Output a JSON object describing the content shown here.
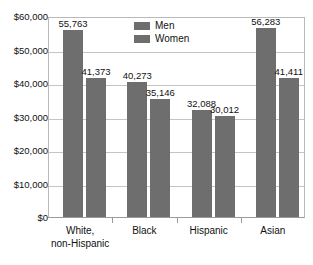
{
  "chart_data": {
    "type": "bar",
    "title": "",
    "xlabel": "",
    "ylabel": "",
    "categories": [
      "White, non-Hispanic",
      "Black",
      "Hispanic",
      "Asian"
    ],
    "category_lines": [
      [
        "White,",
        "non-Hispanic"
      ],
      [
        "Black"
      ],
      [
        "Hispanic"
      ],
      [
        "Asian"
      ]
    ],
    "series": [
      {
        "name": "Men",
        "values": [
          55763,
          40273,
          32088,
          56283
        ],
        "value_labels": [
          "55,763",
          "40,273",
          "32,088",
          "56,283"
        ],
        "color": "#6e6e6e"
      },
      {
        "name": "Women",
        "values": [
          41373,
          35146,
          30012,
          41411
        ],
        "value_labels": [
          "41,373",
          "35,146",
          "30,012",
          "41,411"
        ],
        "color": "#6e6e6e"
      }
    ],
    "ylim": [
      0,
      60000
    ],
    "ytick_values": [
      0,
      10000,
      20000,
      30000,
      40000,
      50000,
      60000
    ],
    "ytick_labels": [
      "$0",
      "$10,000",
      "$20,000",
      "$30,000",
      "$40,000",
      "$50,000",
      "$60,000"
    ],
    "grid": true,
    "legend_position": "top-center",
    "legend_entries": [
      "Men",
      "Women"
    ]
  }
}
